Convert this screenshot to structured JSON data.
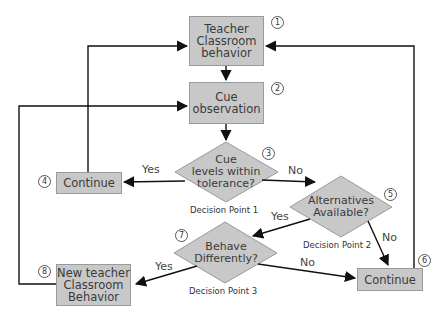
{
  "diagram": {
    "type": "flowchart",
    "colors": {
      "node_fill": "#c8c8c8",
      "node_border": "#9a9a9a",
      "line": "#111111",
      "text": "#3a3a3a"
    },
    "nodes": {
      "n1": {
        "number": "1",
        "label": "Teacher Classroom behavior",
        "lines": [
          "Teacher",
          "Classroom",
          "behavior"
        ]
      },
      "n2": {
        "number": "2",
        "label": "Cue observation",
        "lines": [
          "Cue",
          "observation"
        ]
      },
      "n3": {
        "number": "3",
        "label": "Cue levels within tolerance?",
        "lines": [
          "Cue",
          "levels within",
          "tolerance?"
        ],
        "caption": "Decision Point 1"
      },
      "n4": {
        "number": "4",
        "label": "Continue"
      },
      "n5": {
        "number": "5",
        "label": "Alternatives Available?",
        "lines": [
          "Alternatives",
          "Available?"
        ],
        "caption": "Decision Point  2"
      },
      "n6": {
        "number": "6",
        "label": "Continue"
      },
      "n7": {
        "number": "7",
        "label": "Behave Differently?",
        "lines": [
          "Behave",
          "Differently?"
        ],
        "caption": "Decision Point  3"
      },
      "n8": {
        "number": "8",
        "label": "New teacher Classroom Behavior",
        "lines": [
          "New teacher",
          "Classroom",
          "Behavior"
        ]
      }
    },
    "edge_labels": {
      "n3_to_n4": "Yes",
      "n3_to_n5": "No",
      "n5_to_n7": "Yes",
      "n5_to_n6": "No",
      "n7_to_n8": "Yes",
      "n7_to_n6": "No"
    },
    "edges": [
      {
        "from": "n1",
        "to": "n2"
      },
      {
        "from": "n2",
        "to": "n3"
      },
      {
        "from": "n3",
        "to": "n4",
        "label": "Yes"
      },
      {
        "from": "n3",
        "to": "n5",
        "label": "No"
      },
      {
        "from": "n4",
        "to": "n1"
      },
      {
        "from": "n5",
        "to": "n7",
        "label": "Yes"
      },
      {
        "from": "n5",
        "to": "n6",
        "label": "No"
      },
      {
        "from": "n6",
        "to": "n1"
      },
      {
        "from": "n7",
        "to": "n8",
        "label": "Yes"
      },
      {
        "from": "n7",
        "to": "n6",
        "label": "No"
      },
      {
        "from": "n8",
        "to": "n2"
      }
    ]
  }
}
